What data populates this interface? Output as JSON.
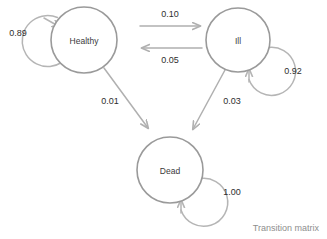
{
  "diagram": {
    "type": "state-transition-diagram",
    "caption": "Transition matrix",
    "colors": {
      "node_stroke": "#9a9a9a",
      "loop_stroke": "#b5b5b5",
      "arrow_stroke": "#b0b0b0",
      "node_text": "#3a3a3a",
      "label_text": "#2e2e2e",
      "caption_text": "#8e8e8e",
      "background": "#ffffff"
    },
    "nodes": [
      {
        "id": "healthy",
        "label": "Healthy",
        "cx": 84,
        "cy": 40,
        "r": 33
      },
      {
        "id": "ill",
        "label": "Ill",
        "cx": 238,
        "cy": 40,
        "r": 32
      },
      {
        "id": "dead",
        "label": "Dead",
        "cx": 170,
        "cy": 170,
        "r": 33
      }
    ],
    "transitions": [
      {
        "from": "healthy",
        "to": "healthy",
        "probability": "0.89",
        "kind": "self-loop",
        "label_x": 18,
        "label_y": 33
      },
      {
        "from": "healthy",
        "to": "ill",
        "probability": "0.10",
        "kind": "directed",
        "label_x": 170,
        "label_y": 14
      },
      {
        "from": "ill",
        "to": "healthy",
        "probability": "0.05",
        "kind": "directed",
        "label_x": 170,
        "label_y": 60
      },
      {
        "from": "ill",
        "to": "ill",
        "probability": "0.92",
        "kind": "self-loop",
        "label_x": 293,
        "label_y": 71
      },
      {
        "from": "healthy",
        "to": "dead",
        "probability": "0.01",
        "kind": "directed",
        "label_x": 110,
        "label_y": 101
      },
      {
        "from": "ill",
        "to": "dead",
        "probability": "0.03",
        "kind": "directed",
        "label_x": 232,
        "label_y": 101
      },
      {
        "from": "dead",
        "to": "dead",
        "probability": "1.00",
        "kind": "self-loop",
        "label_x": 232,
        "label_y": 192
      }
    ]
  }
}
